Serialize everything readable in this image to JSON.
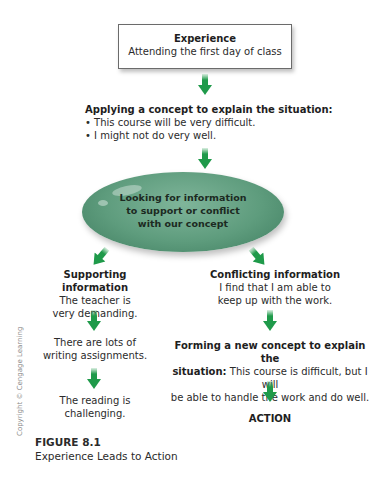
{
  "experience": {
    "title": "Experience",
    "subtitle": "Attending the first day of class"
  },
  "applying": {
    "heading": "Applying a concept to explain the situation:",
    "bullets": [
      "• This course will be very difficult.",
      "• I might not do very well."
    ]
  },
  "ellipse": {
    "lines": [
      "Looking for information",
      "to support or conflict",
      "with our concept"
    ]
  },
  "supporting": {
    "heading": "Supporting information",
    "steps": [
      [
        "The teacher is",
        "very demanding."
      ],
      [
        "There are lots of",
        "writing assignments."
      ],
      [
        "The reading is",
        "challenging."
      ]
    ]
  },
  "conflicting": {
    "heading": "Conflicting information",
    "lines": [
      "I find that I am able to",
      "keep up with the work."
    ]
  },
  "forming": {
    "heading_line1": "Forming a new concept to explain the",
    "heading_bold2": "situation:",
    "line2_rest": " This course is difficult, but I will",
    "line3": "be able to handle the work and do well."
  },
  "action": {
    "label": "ACTION"
  },
  "copyright": "Copyright © Cengage Learning",
  "figure": {
    "label": "FIGURE 8.1",
    "caption": "Experience Leads to Action"
  },
  "colors": {
    "arrow": "#1f9a4a",
    "ellipse": "#5e9c7d",
    "box_border": "#6b6b6b"
  }
}
